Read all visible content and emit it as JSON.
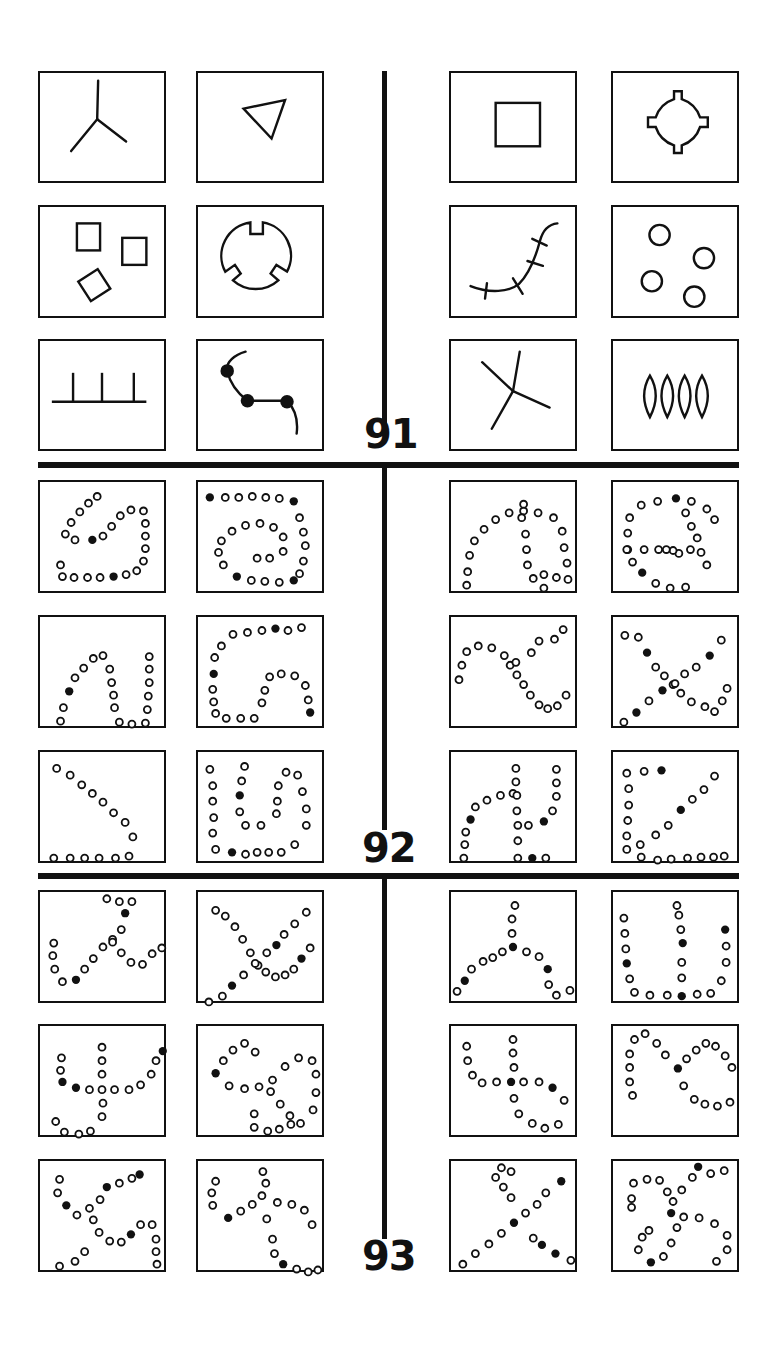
{
  "page": {
    "ink_color": "#111111",
    "background": "#ffffff"
  },
  "problems": [
    {
      "number": "91",
      "description": "Line-drawn figures; left vs right classes",
      "left": [
        {
          "id": "91-L1",
          "content": "three-line tripod / Y junction (three segments meeting at a point)"
        },
        {
          "id": "91-L2",
          "content": "small outline triangle"
        },
        {
          "id": "91-L3",
          "content": "three outline squares, one rotated"
        },
        {
          "id": "91-L4",
          "content": "circle with three rectangular notches cut inward"
        },
        {
          "id": "91-L5",
          "content": "horizontal base line with three vertical ticks"
        },
        {
          "id": "91-L6",
          "content": "curved line with three filled dots"
        }
      ],
      "right": [
        {
          "id": "91-R1",
          "content": "single outline square"
        },
        {
          "id": "91-R2",
          "content": "circle with four outward rectangular tabs"
        },
        {
          "id": "91-R3",
          "content": "curved line with four cross ticks"
        },
        {
          "id": "91-R4",
          "content": "four outline circles"
        },
        {
          "id": "91-R5",
          "content": "four lines meeting at a point (X-like junction)"
        },
        {
          "id": "91-R6",
          "content": "four adjacent lens/ellipse shapes in a row"
        }
      ]
    },
    {
      "number": "92",
      "description": "Dotted curves with some filled dots",
      "left": [
        {
          "id": "92-L1",
          "content": "loop-shaped dotted curve with 2 filled dots"
        },
        {
          "id": "92-L2",
          "content": "spiral dotted curve with 4 filled dots"
        },
        {
          "id": "92-L3",
          "content": "n-shaped dotted curve with 1 filled dot"
        },
        {
          "id": "92-L4",
          "content": "hook-shaped dotted curve with 3 filled dots"
        },
        {
          "id": "92-L5",
          "content": "diagonal dotted line plus dotted base line, no filled dots"
        },
        {
          "id": "92-L6",
          "content": "double-U dotted curve with 2 filled dots"
        }
      ],
      "right": [
        {
          "id": "92-R1",
          "content": "m-shaped dotted curve, no filled dots"
        },
        {
          "id": "92-R2",
          "content": "6-like dotted curve with 3 filled dots"
        },
        {
          "id": "92-R3",
          "content": "S-wave dotted curve, no filled dots"
        },
        {
          "id": "92-R4",
          "content": "X of dotted lines with 4 filled dots"
        },
        {
          "id": "92-R5",
          "content": "branching dotted curve with 3 filled dots"
        },
        {
          "id": "92-R6",
          "content": "dotted open frame with diagonal, 2 filled dots"
        }
      ]
    },
    {
      "number": "93",
      "description": "Dotted crossing curves with filled dots",
      "left": [
        {
          "id": "93-L1",
          "content": "crossing dotted curves with 2 filled dots"
        },
        {
          "id": "93-L2",
          "content": "X of dotted lines with 3 filled dots"
        },
        {
          "id": "93-L3",
          "content": "crossing dotted curves with 3 filled dots"
        },
        {
          "id": "93-L4",
          "content": "crossing dotted loops with 1 filled dot"
        },
        {
          "id": "93-L5",
          "content": "crossing dotted curves with 4 filled dots"
        },
        {
          "id": "93-L6",
          "content": "crossing dotted curves with 2 filled dots"
        }
      ],
      "right": [
        {
          "id": "93-R1",
          "content": "dotted tripod with 3 filled dots"
        },
        {
          "id": "93-R2",
          "content": "dotted W/U shape with 4 filled dots"
        },
        {
          "id": "93-R3",
          "content": "crossing dotted curves with 2 filled dots"
        },
        {
          "id": "93-R4",
          "content": "dotted loop curve with 1 filled dot"
        },
        {
          "id": "93-R5",
          "content": "X of dotted lines with 3 filled dots"
        },
        {
          "id": "93-R6",
          "content": "crossing dotted curves with 3 filled dots"
        }
      ]
    }
  ]
}
